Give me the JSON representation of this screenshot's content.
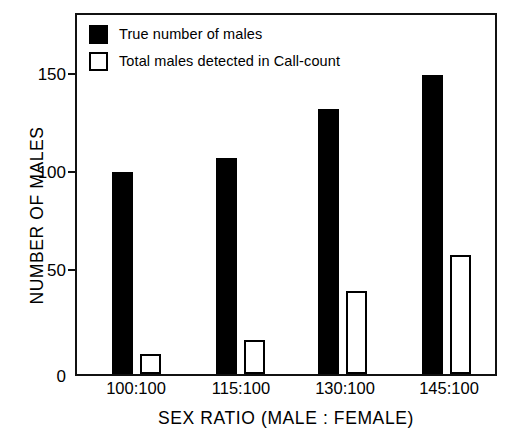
{
  "chart_data": {
    "type": "bar",
    "title": "",
    "xlabel": "SEX RATIO (MALE : FEMALE)",
    "ylabel": "NUMBER OF MALES",
    "categories": [
      "100:100",
      "115:100",
      "130:100",
      "145:100"
    ],
    "series": [
      {
        "name": "True number of males",
        "values": [
          100,
          107,
          131,
          148
        ],
        "style": "filled",
        "color": "#000000"
      },
      {
        "name": "Total males detected in Call-count",
        "values": [
          10,
          17,
          41,
          59
        ],
        "style": "hollow",
        "color": "#ffffff"
      }
    ],
    "ylim": [
      0,
      180
    ],
    "yticks": [
      0,
      50,
      100,
      150
    ],
    "ytick_labels": [
      "0",
      "50",
      "100",
      "150"
    ],
    "grid": false,
    "legend_position": "top-left",
    "legend_entries": [
      "True number of males",
      "Total males detected in Call-count"
    ]
  },
  "legend": {
    "items": [
      {
        "label": "True number of males",
        "swatch": "filled-square"
      },
      {
        "label": "Total males detected in Call-count",
        "swatch": "hollow-square"
      }
    ]
  },
  "axes": {
    "y_title": "NUMBER OF MALES",
    "x_title": "SEX RATIO (MALE : FEMALE)",
    "y_ticks": [
      "150",
      "100",
      "50",
      "0"
    ],
    "x_ticks": [
      "100:100",
      "115:100",
      "130:100",
      "145:100"
    ]
  }
}
